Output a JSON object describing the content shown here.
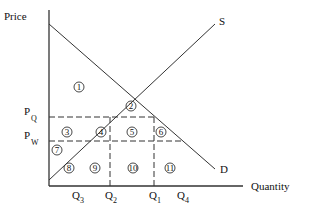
{
  "diagram": {
    "axes": {
      "y_label": "Price",
      "x_label": "Quantity",
      "origin": [
        49,
        186
      ],
      "y_top": 10,
      "x_right": 243
    },
    "curves": {
      "demand": {
        "label": "D",
        "from": [
          49,
          24
        ],
        "to": [
          215,
          169
        ],
        "label_pos": [
          220,
          173
        ]
      },
      "supply": {
        "label": "S",
        "from": [
          49,
          180
        ],
        "to": [
          215,
          24
        ],
        "label_pos": [
          219,
          25
        ]
      }
    },
    "price_levels": [
      {
        "name": "P",
        "sub": "Q",
        "y": 117,
        "x_end": 154,
        "label_x": 24
      },
      {
        "name": "P",
        "sub": "W",
        "y": 141,
        "x_end": 182,
        "label_x": 24
      }
    ],
    "quantity_levels": [
      {
        "name": "Q",
        "sub": "3",
        "x": 77,
        "dashed": false
      },
      {
        "name": "Q",
        "sub": "2",
        "x": 110,
        "dashed": true,
        "y_top": 117
      },
      {
        "name": "Q",
        "sub": "1",
        "x": 154,
        "dashed": true,
        "y_top": 117
      },
      {
        "name": "Q",
        "sub": "4",
        "x": 182,
        "dashed": false
      }
    ],
    "regions": [
      {
        "n": "1",
        "x": 79,
        "y": 87
      },
      {
        "n": "2",
        "x": 131,
        "y": 106
      },
      {
        "n": "3",
        "x": 67,
        "y": 132
      },
      {
        "n": "4",
        "x": 101,
        "y": 132
      },
      {
        "n": "5",
        "x": 132,
        "y": 132
      },
      {
        "n": "6",
        "x": 161,
        "y": 132
      },
      {
        "n": "7",
        "x": 57,
        "y": 150
      },
      {
        "n": "8",
        "x": 69,
        "y": 168
      },
      {
        "n": "9",
        "x": 95,
        "y": 168
      },
      {
        "n": "10",
        "x": 133,
        "y": 168
      },
      {
        "n": "11",
        "x": 170,
        "y": 168
      }
    ],
    "colors": {
      "line": "#333333",
      "text": "#111111"
    }
  }
}
